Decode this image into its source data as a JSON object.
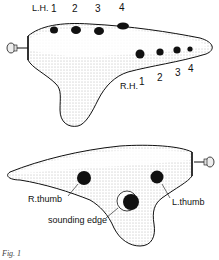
{
  "figure": {
    "caption": "Fig. 1",
    "top_view": {
      "left_hand_label": "L.H.",
      "left_hand_holes": [
        "1",
        "2",
        "3",
        "4"
      ],
      "right_hand_label": "R.H.",
      "right_hand_holes": [
        "1",
        "2",
        "3",
        "4"
      ]
    },
    "bottom_view": {
      "right_thumb_label": "R.thumb",
      "left_thumb_label": "L.thumb",
      "sounding_edge_label": "sounding edge"
    }
  }
}
